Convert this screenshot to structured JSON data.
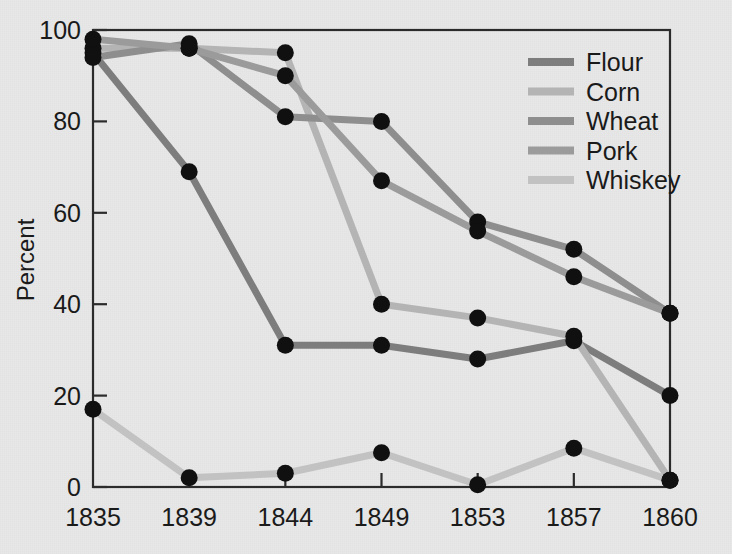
{
  "chart_data": {
    "type": "line",
    "title": "",
    "xlabel": "",
    "ylabel": "Percent",
    "categories": [
      "1835",
      "1839",
      "1844",
      "1849",
      "1853",
      "1857",
      "1860"
    ],
    "ylim": [
      0,
      100
    ],
    "yticks": [
      0,
      20,
      40,
      60,
      80,
      100
    ],
    "ytick_labels": [
      "0",
      "20",
      "40",
      "60",
      "80",
      "100"
    ],
    "grid": false,
    "legend_position": "upper-right-inside",
    "marker": "filled-circle",
    "marker_color": "#101010",
    "series": [
      {
        "name": "Flour",
        "color": "#7d7d7d",
        "values": [
          95,
          69,
          31,
          31,
          28,
          32,
          20
        ]
      },
      {
        "name": "Corn",
        "color": "#b4b4b4",
        "values": [
          96,
          96,
          95,
          40,
          37,
          33,
          1.5
        ]
      },
      {
        "name": "Wheat",
        "color": "#8e8e8e",
        "values": [
          94,
          97,
          81,
          80,
          58,
          52,
          38
        ]
      },
      {
        "name": "Pork",
        "color": "#9b9b9b",
        "values": [
          98,
          96,
          90,
          67,
          56,
          46,
          38
        ]
      },
      {
        "name": "Whiskey",
        "color": "#c2c2c2",
        "values": [
          17,
          2,
          3,
          7.5,
          0.5,
          8.5,
          1.5
        ]
      }
    ]
  },
  "legend": {
    "entries": [
      "Flour",
      "Corn",
      "Wheat",
      "Pork",
      "Whiskey"
    ]
  },
  "axes": {
    "y_title": "Percent"
  },
  "colors": {
    "background": "#e8e8e8",
    "frame": "#2b2b2b",
    "text": "#1a1a1a"
  }
}
